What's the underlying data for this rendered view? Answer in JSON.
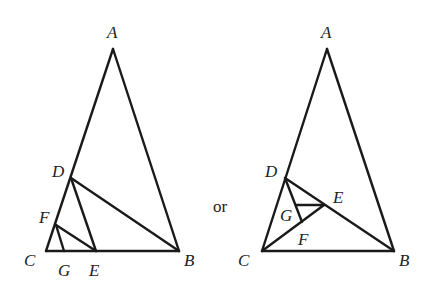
{
  "connector_text": "or",
  "figures": [
    {
      "id": "left",
      "points": {
        "A": [
          113,
          49
        ],
        "B": [
          179,
          251
        ],
        "C": [
          46,
          251
        ],
        "D": [
          71,
          178
        ],
        "E": [
          96,
          251
        ],
        "F": [
          56,
          225
        ],
        "G": [
          64,
          251
        ]
      },
      "segments": [
        [
          "A",
          "B"
        ],
        [
          "A",
          "C"
        ],
        [
          "C",
          "B"
        ],
        [
          "D",
          "B"
        ],
        [
          "D",
          "E"
        ],
        [
          "F",
          "E"
        ],
        [
          "F",
          "G"
        ]
      ],
      "labels": [
        {
          "text": "A",
          "x": 107,
          "y": 38
        },
        {
          "text": "D",
          "x": 52,
          "y": 177
        },
        {
          "text": "F",
          "x": 39,
          "y": 223
        },
        {
          "text": "C",
          "x": 24,
          "y": 266
        },
        {
          "text": "G",
          "x": 58,
          "y": 276
        },
        {
          "text": "E",
          "x": 89,
          "y": 276
        },
        {
          "text": "B",
          "x": 184,
          "y": 266
        }
      ]
    },
    {
      "id": "right",
      "points": {
        "A": [
          327,
          49
        ],
        "B": [
          394,
          251
        ],
        "C": [
          262,
          251
        ],
        "D": [
          285,
          178
        ],
        "E": [
          324,
          205
        ],
        "F": [
          302,
          222
        ],
        "G": [
          296,
          205
        ]
      },
      "segments": [
        [
          "A",
          "B"
        ],
        [
          "A",
          "C"
        ],
        [
          "C",
          "B"
        ],
        [
          "D",
          "B"
        ],
        [
          "C",
          "E"
        ],
        [
          "D",
          "F"
        ],
        [
          "G",
          "E"
        ]
      ],
      "labels": [
        {
          "text": "A",
          "x": 321,
          "y": 38
        },
        {
          "text": "D",
          "x": 265,
          "y": 177
        },
        {
          "text": "E",
          "x": 333,
          "y": 203
        },
        {
          "text": "G",
          "x": 280,
          "y": 221
        },
        {
          "text": "F",
          "x": 298,
          "y": 245
        },
        {
          "text": "C",
          "x": 238,
          "y": 266
        },
        {
          "text": "B",
          "x": 399,
          "y": 266
        }
      ]
    }
  ]
}
